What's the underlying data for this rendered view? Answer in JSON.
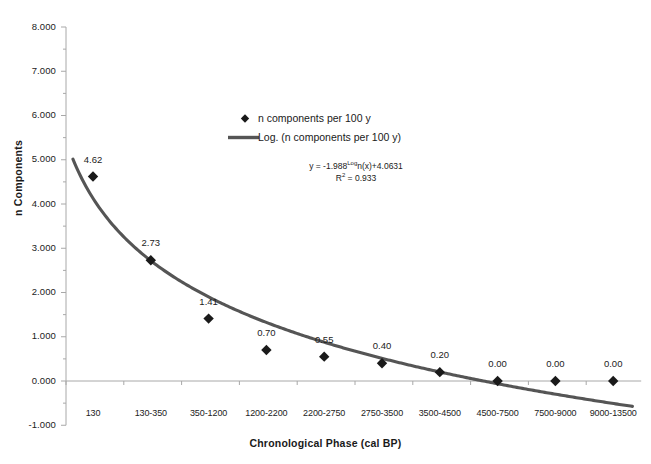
{
  "chart_data": {
    "type": "scatter",
    "title": "",
    "xlabel": "Chronological Phase (cal BP)",
    "ylabel": "n Components",
    "categories": [
      "130",
      "130-350",
      "350-1200",
      "1200-2200",
      "2200-2750",
      "2750-3500",
      "3500-4500",
      "4500-7500",
      "7500-9000",
      "9000-13500"
    ],
    "values": [
      4.62,
      2.73,
      1.41,
      0.7,
      0.55,
      0.4,
      0.2,
      0.0,
      0.0,
      0.0
    ],
    "point_labels": [
      "4.62",
      "2.73",
      "1.41",
      "0.70",
      "0.55",
      "0.40",
      "0.20",
      "0.00",
      "0.00",
      "0.00"
    ],
    "series": [
      {
        "name": "n components per 100 y",
        "values": [
          4.62,
          2.73,
          1.41,
          0.7,
          0.55,
          0.4,
          0.2,
          0.0,
          0.0,
          0.0
        ]
      }
    ],
    "trendline": {
      "name": "Log. (n components per 100 y)",
      "equation": "y = -1.988Ln(x)+4.0631",
      "r_squared_label": "R2 = 0.933",
      "slope": -1.988,
      "intercept": 4.0631,
      "r_squared": 0.933
    },
    "ylim": [
      -1.0,
      8.0
    ],
    "ytick_labels": [
      "8.000",
      "7.000",
      "6.000",
      "5.000",
      "4.000",
      "3.000",
      "2.000",
      "1.000",
      "0.000",
      "-1.000"
    ],
    "ytick_values": [
      8,
      7,
      6,
      5,
      4,
      3,
      2,
      1,
      0,
      -1
    ],
    "ytick_step": 1.0,
    "yminor_step": 0.5,
    "grid": false,
    "legend_position": "upper-center",
    "colors": {
      "marker": "#1a1a1a",
      "trendline": "#555555",
      "axis": "#a8a8a8",
      "text": "#1a1a1a"
    }
  },
  "legend": {
    "entries": [
      {
        "label": "n components per 100 y",
        "marker": "diamond"
      },
      {
        "label": "Log. (n components per 100 y)",
        "marker": "line"
      }
    ]
  },
  "equation": {
    "line1_pre": "y = -1.988",
    "line1_sup": "Log",
    "line1_post": "n(x)+4.0631",
    "line2_pre": "R",
    "line2_sup": "2",
    "line2_post": " = 0.933"
  },
  "axes": {
    "x_title": "Chronological Phase (cal BP)",
    "y_title": "n Components"
  }
}
